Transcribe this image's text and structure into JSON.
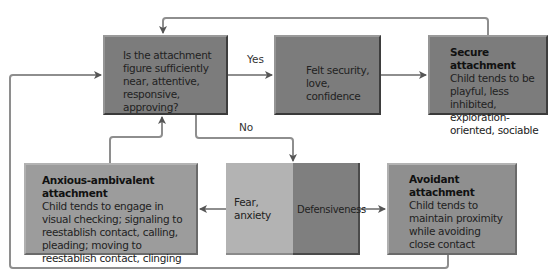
{
  "diagram": {
    "type": "flowchart",
    "colors": {
      "dark_box": "#7c7c7c",
      "mid_box": "#9c9c9c",
      "light_box": "#b3b3b3",
      "connector": "#8a8a8a",
      "arrowhead": "#555555"
    },
    "nodes": {
      "question": {
        "text": "Is the attachment figure sufficiently near, attentive, responsive, approving?"
      },
      "felt_security": {
        "text": "Felt security, love, confidence"
      },
      "secure": {
        "title": "Secure attachment",
        "text": "Child tends to be playful, less inhibited, exploration-oriented, sociable"
      },
      "fear": {
        "text": "Fear, anxiety"
      },
      "defensiveness": {
        "text": "Defensiveness"
      },
      "anxious": {
        "title": "Anxious-ambivalent attachment",
        "text": "Child tends to engage in visual checking; signaling to reestablish contact, calling, pleading; moving to reestablish contact, clinging"
      },
      "avoidant": {
        "title": "Avoidant attachment",
        "text": "Child tends to maintain proximity while avoiding close contact"
      }
    },
    "edge_labels": {
      "yes": "Yes",
      "no": "No"
    },
    "edges": [
      {
        "from": "question",
        "to": "felt_security",
        "label": "Yes"
      },
      {
        "from": "felt_security",
        "to": "secure"
      },
      {
        "from": "secure",
        "to": "question"
      },
      {
        "from": "question",
        "to": "defensiveness",
        "label": "No"
      },
      {
        "from": "fear",
        "to": "anxious"
      },
      {
        "from": "defensiveness",
        "to": "avoidant"
      },
      {
        "from": "anxious",
        "to": "question"
      },
      {
        "from": "avoidant",
        "to": "question"
      }
    ]
  }
}
